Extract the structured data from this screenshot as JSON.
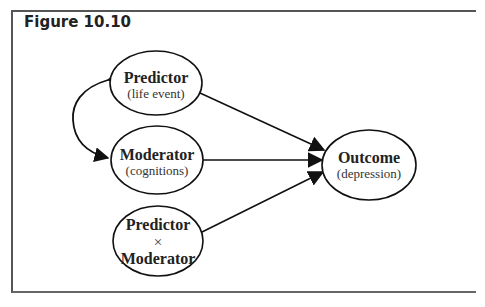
{
  "figure": {
    "title": "Figure 10.10"
  },
  "nodes": {
    "predictor": {
      "label": "Predictor",
      "sublabel": "(life event)"
    },
    "moderator": {
      "label": "Moderator",
      "sublabel": "(cognitions)"
    },
    "interaction": {
      "label_top": "Predictor",
      "operator": "×",
      "label_bottom": "Moderator"
    },
    "outcome": {
      "label": "Outcome",
      "sublabel": "(depression)"
    }
  },
  "edges": [
    {
      "from": "predictor",
      "to": "moderator",
      "type": "bidirectional-curved"
    },
    {
      "from": "predictor",
      "to": "outcome",
      "type": "directed"
    },
    {
      "from": "moderator",
      "to": "outcome",
      "type": "directed"
    },
    {
      "from": "interaction",
      "to": "outcome",
      "type": "directed"
    }
  ],
  "colors": {
    "line": "#1a1a1a",
    "frame": "#555555",
    "text": "#222222"
  }
}
